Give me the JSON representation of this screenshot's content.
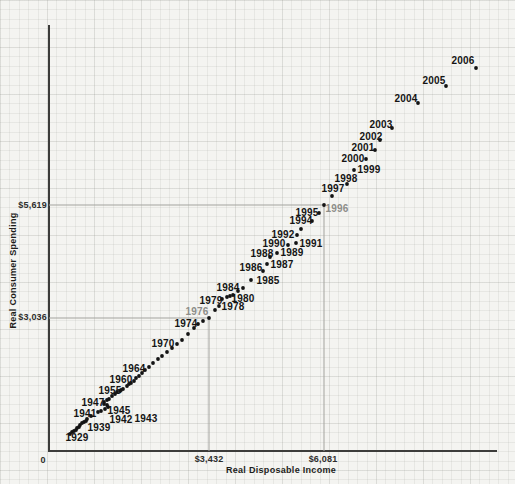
{
  "figure": {
    "bg_color": "#f4f4f1",
    "axis_color": "#3c3c3a",
    "ref_line_color": "#a3a39e",
    "dot_color": "#141414",
    "label_color": "#141414",
    "muted_label_color": "#8d8d89"
  },
  "chart_data": {
    "type": "scatter",
    "title": "",
    "xlabel": "Real Disposable Income",
    "ylabel": "Real Consumer Spending",
    "grid": "on",
    "legend": "none",
    "x_ticks": [
      {
        "label": "0",
        "value": 0
      },
      {
        "label": "$3,432",
        "value": 3432
      },
      {
        "label": "$6,081",
        "value": 6081
      }
    ],
    "y_ticks": [
      {
        "label": "$3,036",
        "value": 3036
      },
      {
        "label": "$5,619",
        "value": 5619
      }
    ],
    "highlight_points": [
      {
        "year": 1976,
        "income_label": "$3,432",
        "spending_label": "$3,036"
      },
      {
        "year": 1996,
        "income_label": "$6,081",
        "spending_label": "$5,619"
      }
    ],
    "reference_lines": [
      {
        "name": "spending-5619",
        "x1": 49,
        "y1": 205,
        "x2": 324,
        "y2": 205
      },
      {
        "name": "income-6081",
        "x1": 324,
        "y1": 205,
        "x2": 324,
        "y2": 451
      },
      {
        "name": "spending-3036",
        "x1": 49,
        "y1": 318,
        "x2": 209,
        "y2": 318
      },
      {
        "name": "income-3432",
        "x1": 209,
        "y1": 318,
        "x2": 209,
        "y2": 451
      }
    ],
    "points": [
      {
        "year": 1929,
        "income": 240,
        "spending": 370,
        "px": 70,
        "py": 434,
        "label": {
          "x": 77,
          "y": 437
        }
      },
      {
        "year": 1930,
        "income": 280,
        "spending": 410,
        "px": 72,
        "py": 432
      },
      {
        "year": 1931,
        "income": 330,
        "spending": 440,
        "px": 74,
        "py": 431
      },
      {
        "year": 1932,
        "income": 370,
        "spending": 460,
        "px": 76,
        "py": 430
      },
      {
        "year": 1933,
        "income": 400,
        "spending": 510,
        "px": 77,
        "py": 428
      },
      {
        "year": 1934,
        "income": 440,
        "spending": 530,
        "px": 79,
        "py": 427
      },
      {
        "year": 1935,
        "income": 470,
        "spending": 570,
        "px": 80,
        "py": 425
      },
      {
        "year": 1936,
        "income": 510,
        "spending": 620,
        "px": 82,
        "py": 423
      },
      {
        "year": 1937,
        "income": 560,
        "spending": 640,
        "px": 84,
        "py": 422
      },
      {
        "year": 1938,
        "income": 600,
        "spending": 670,
        "px": 86,
        "py": 421
      },
      {
        "year": 1939,
        "income": 630,
        "spending": 710,
        "px": 87,
        "py": 419,
        "label": {
          "x": 99,
          "y": 427
        }
      },
      {
        "year": 1940,
        "income": 720,
        "spending": 780,
        "px": 91,
        "py": 416
      },
      {
        "year": 1941,
        "income": 830,
        "spending": 870,
        "px": 98,
        "py": 412,
        "label": {
          "x": 85,
          "y": 413
        }
      },
      {
        "year": 1942,
        "income": 950,
        "spending": 900,
        "px": 101,
        "py": 411,
        "label": {
          "x": 121,
          "y": 419
        }
      },
      {
        "year": 1943,
        "income": 1040,
        "spending": 940,
        "px": 105,
        "py": 409,
        "label": {
          "x": 146,
          "y": 418
        }
      },
      {
        "year": 1944,
        "income": 1110,
        "spending": 990,
        "px": 108,
        "py": 407
      },
      {
        "year": 1945,
        "income": 1090,
        "spending": 1040,
        "px": 107,
        "py": 405,
        "label": {
          "x": 119,
          "y": 410
        }
      },
      {
        "year": 1946,
        "income": 1020,
        "spending": 1060,
        "px": 104,
        "py": 404
      },
      {
        "year": 1947,
        "income": 990,
        "spending": 1100,
        "px": 104,
        "py": 402,
        "label": {
          "x": 93,
          "y": 402
        }
      },
      {
        "year": 1948,
        "income": 1090,
        "spending": 1150,
        "px": 107,
        "py": 400
      },
      {
        "year": 1949,
        "income": 1130,
        "spending": 1170,
        "px": 109,
        "py": 399
      },
      {
        "year": 1950,
        "income": 1200,
        "spending": 1240,
        "px": 112,
        "py": 396
      },
      {
        "year": 1951,
        "income": 1270,
        "spending": 1290,
        "px": 115,
        "py": 394
      },
      {
        "year": 1952,
        "income": 1320,
        "spending": 1330,
        "px": 117,
        "py": 392
      },
      {
        "year": 1953,
        "income": 1390,
        "spending": 1360,
        "px": 120,
        "py": 391
      },
      {
        "year": 1954,
        "income": 1410,
        "spending": 1380,
        "px": 121,
        "py": 390
      },
      {
        "year": 1955,
        "income": 1450,
        "spending": 1400,
        "px": 123,
        "py": 389,
        "label": {
          "x": 110,
          "y": 390
        }
      },
      {
        "year": 1956,
        "income": 1550,
        "spending": 1470,
        "px": 127,
        "py": 386
      },
      {
        "year": 1957,
        "income": 1590,
        "spending": 1520,
        "px": 129,
        "py": 384
      },
      {
        "year": 1958,
        "income": 1640,
        "spending": 1540,
        "px": 131,
        "py": 383
      },
      {
        "year": 1959,
        "income": 1710,
        "spending": 1590,
        "px": 134,
        "py": 381
      },
      {
        "year": 1960,
        "income": 1750,
        "spending": 1660,
        "px": 136,
        "py": 378,
        "label": {
          "x": 121,
          "y": 379
        }
      },
      {
        "year": 1961,
        "income": 1820,
        "spending": 1700,
        "px": 139,
        "py": 376
      },
      {
        "year": 1962,
        "income": 1890,
        "spending": 1770,
        "px": 142,
        "py": 373
      },
      {
        "year": 1963,
        "income": 1960,
        "spending": 1840,
        "px": 145,
        "py": 370
      },
      {
        "year": 1964,
        "income": 2050,
        "spending": 1910,
        "px": 149,
        "py": 367,
        "label": {
          "x": 134,
          "y": 368
        }
      },
      {
        "year": 1965,
        "income": 2140,
        "spending": 2000,
        "px": 153,
        "py": 363
      },
      {
        "year": 1966,
        "income": 2260,
        "spending": 2090,
        "px": 158,
        "py": 359
      },
      {
        "year": 1967,
        "income": 2350,
        "spending": 2160,
        "px": 162,
        "py": 356
      },
      {
        "year": 1968,
        "income": 2470,
        "spending": 2250,
        "px": 167,
        "py": 352
      },
      {
        "year": 1969,
        "income": 2580,
        "spending": 2350,
        "px": 172,
        "py": 348
      },
      {
        "year": 1970,
        "income": 2700,
        "spending": 2440,
        "px": 177,
        "py": 344,
        "label": {
          "x": 163,
          "y": 343
        }
      },
      {
        "year": 1971,
        "income": 2810,
        "spending": 2530,
        "px": 182,
        "py": 340
      },
      {
        "year": 1972,
        "income": 2950,
        "spending": 2670,
        "px": 188,
        "py": 334
      },
      {
        "year": 1973,
        "income": 3090,
        "spending": 2810,
        "px": 194,
        "py": 328
      },
      {
        "year": 1974,
        "income": 3180,
        "spending": 2900,
        "px": 198,
        "py": 324,
        "label": {
          "x": 186,
          "y": 323
        }
      },
      {
        "year": 1975,
        "income": 3290,
        "spending": 2970,
        "px": 203,
        "py": 321
      },
      {
        "year": 1976,
        "income": 3432,
        "spending": 3036,
        "px": 209,
        "py": 318,
        "label": {
          "x": 197,
          "y": 311,
          "muted": true
        }
      },
      {
        "year": 1977,
        "income": 3570,
        "spending": 3220,
        "px": 215,
        "py": 310
      },
      {
        "year": 1978,
        "income": 3660,
        "spending": 3310,
        "px": 219,
        "py": 306,
        "label": {
          "x": 233,
          "y": 306
        }
      },
      {
        "year": 1979,
        "income": 3730,
        "spending": 3470,
        "px": 222,
        "py": 299,
        "label": {
          "x": 211,
          "y": 300
        }
      },
      {
        "year": 1980,
        "income": 3850,
        "spending": 3520,
        "px": 227,
        "py": 297,
        "label": {
          "x": 243,
          "y": 298
        }
      },
      {
        "year": 1981,
        "income": 3920,
        "spending": 3540,
        "px": 230,
        "py": 296
      },
      {
        "year": 1982,
        "income": 3980,
        "spending": 3570,
        "px": 233,
        "py": 295
      },
      {
        "year": 1983,
        "income": 4100,
        "spending": 3660,
        "px": 238,
        "py": 291
      },
      {
        "year": 1984,
        "income": 4210,
        "spending": 3730,
        "px": 243,
        "py": 288,
        "label": {
          "x": 228,
          "y": 287
        }
      },
      {
        "year": 1985,
        "income": 4400,
        "spending": 3910,
        "px": 251,
        "py": 280,
        "label": {
          "x": 268,
          "y": 280
        }
      },
      {
        "year": 1986,
        "income": 4670,
        "spending": 4120,
        "px": 263,
        "py": 271,
        "label": {
          "x": 251,
          "y": 267
        }
      },
      {
        "year": 1987,
        "income": 4770,
        "spending": 4280,
        "px": 267,
        "py": 264,
        "label": {
          "x": 282,
          "y": 264
        }
      },
      {
        "year": 1988,
        "income": 4840,
        "spending": 4440,
        "px": 270,
        "py": 257,
        "label": {
          "x": 262,
          "y": 253
        }
      },
      {
        "year": 1989,
        "income": 5000,
        "spending": 4530,
        "px": 277,
        "py": 253,
        "label": {
          "x": 292,
          "y": 252
        }
      },
      {
        "year": 1990,
        "income": 5250,
        "spending": 4720,
        "px": 288,
        "py": 245,
        "label": {
          "x": 274,
          "y": 243
        }
      },
      {
        "year": 1991,
        "income": 5430,
        "spending": 4760,
        "px": 296,
        "py": 243,
        "label": {
          "x": 311,
          "y": 243
        }
      },
      {
        "year": 1992,
        "income": 5460,
        "spending": 4950,
        "px": 297,
        "py": 235,
        "label": {
          "x": 283,
          "y": 234
        }
      },
      {
        "year": 1993,
        "income": 5550,
        "spending": 5080,
        "px": 301,
        "py": 229
      },
      {
        "year": 1994,
        "income": 5800,
        "spending": 5270,
        "px": 312,
        "py": 221,
        "label": {
          "x": 301,
          "y": 220
        }
      },
      {
        "year": 1995,
        "income": 5960,
        "spending": 5450,
        "px": 319,
        "py": 213,
        "label": {
          "x": 307,
          "y": 212
        }
      },
      {
        "year": 1996,
        "income": 6081,
        "spending": 5619,
        "px": 324,
        "py": 205,
        "label": {
          "x": 337,
          "y": 208,
          "muted": true
        }
      },
      {
        "year": 1997,
        "income": 6260,
        "spending": 5840,
        "px": 332,
        "py": 196,
        "label": {
          "x": 333,
          "y": 188
        }
      },
      {
        "year": 1998,
        "income": 6610,
        "spending": 6120,
        "px": 347,
        "py": 184,
        "label": {
          "x": 346,
          "y": 178
        }
      },
      {
        "year": 1999,
        "income": 6770,
        "spending": 6440,
        "px": 354,
        "py": 170,
        "label": {
          "x": 369,
          "y": 169
        }
      },
      {
        "year": 2000,
        "income": 7050,
        "spending": 6690,
        "px": 366,
        "py": 159,
        "label": {
          "x": 353,
          "y": 158
        }
      },
      {
        "year": 2001,
        "income": 7250,
        "spending": 6900,
        "px": 375,
        "py": 150,
        "label": {
          "x": 363,
          "y": 147
        }
      },
      {
        "year": 2002,
        "income": 7370,
        "spending": 7130,
        "px": 380,
        "py": 140,
        "label": {
          "x": 371,
          "y": 136
        }
      },
      {
        "year": 2003,
        "income": 7640,
        "spending": 7410,
        "px": 392,
        "py": 128,
        "label": {
          "x": 381,
          "y": 124
        }
      },
      {
        "year": 2004,
        "income": 8240,
        "spending": 7980,
        "px": 418,
        "py": 103,
        "label": {
          "x": 406,
          "y": 98
        }
      },
      {
        "year": 2005,
        "income": 8880,
        "spending": 8370,
        "px": 446,
        "py": 86,
        "label": {
          "x": 434,
          "y": 80
        }
      },
      {
        "year": 2006,
        "income": 9570,
        "spending": 8790,
        "px": 476,
        "py": 68,
        "label": {
          "x": 463,
          "y": 60
        }
      }
    ]
  }
}
